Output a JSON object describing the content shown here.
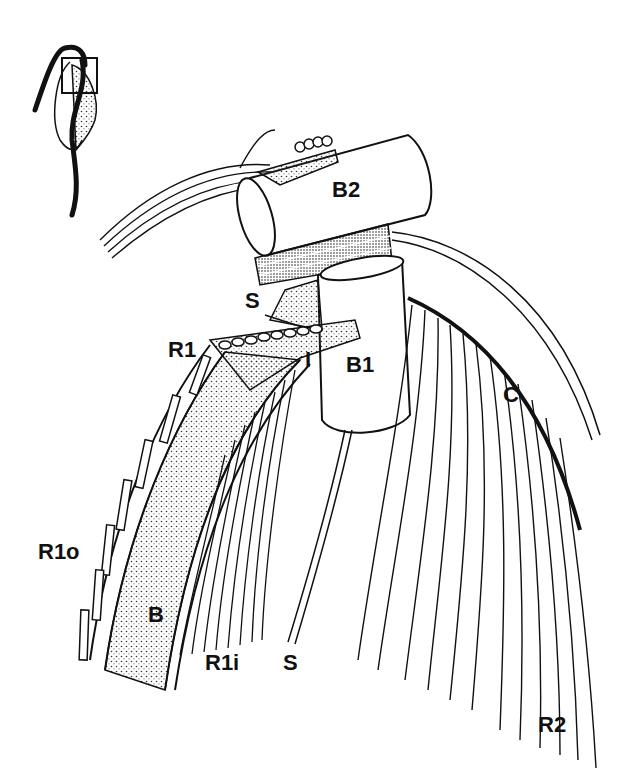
{
  "figure": {
    "type": "flagellar apparatus illustration",
    "inset": {
      "description": "whole cell outline with boxed region indicating enlarged area"
    },
    "labels": {
      "B2": "B2",
      "S_top": "S",
      "R1": "R1",
      "I": "I",
      "B1": "B1",
      "C": "C",
      "R1o": "R1o",
      "B": "B",
      "R1i": "R1i",
      "S_bottom": "S",
      "R2": "R2"
    },
    "colors": {
      "ink": "#111111",
      "background": "#ffffff",
      "stipple": "#555555"
    }
  }
}
